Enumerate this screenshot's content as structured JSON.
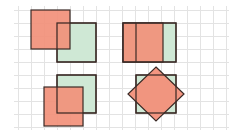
{
  "diagram": {
    "grid": {
      "x0": 18,
      "y0": 10,
      "step": 13,
      "cols": 16,
      "rows": 9,
      "color": "#e3e3e3"
    },
    "colors": {
      "red_fill": "#f2907a",
      "green_fill": "#cfe8d5",
      "stroke": "#3a2a26"
    },
    "panels": [
      {
        "name": "top-left",
        "green": {
          "x": 57,
          "y": 23,
          "w": 39,
          "h": 39
        },
        "red": {
          "x": 31,
          "y": 10,
          "w": 39,
          "h": 39
        }
      },
      {
        "name": "top-right",
        "green": {
          "x": 123,
          "y": 23,
          "w": 53,
          "h": 39
        },
        "red": {
          "x": 123,
          "y": 23,
          "w": 40,
          "h": 39
        },
        "red_divider_x": 136
      },
      {
        "name": "bottom-left",
        "green": {
          "x": 57,
          "y": 75,
          "w": 39,
          "h": 38
        },
        "red": {
          "x": 44,
          "y": 87,
          "w": 39,
          "h": 39
        }
      },
      {
        "name": "bottom-right",
        "green": {
          "x": 136,
          "y": 75,
          "w": 40,
          "h": 38
        },
        "diamond": {
          "cx": 156,
          "cy": 94,
          "rx": 28,
          "ry": 27
        }
      }
    ]
  }
}
